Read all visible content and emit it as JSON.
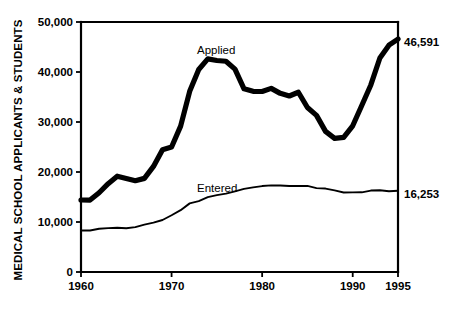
{
  "chart_data": {
    "type": "line",
    "title": "",
    "subtitle": "",
    "xlabel": "",
    "ylabel": "MEDICAL SCHOOL APPLICANTS & STUDENTS",
    "xlim": [
      1960,
      1995
    ],
    "ylim": [
      0,
      50000
    ],
    "grid": false,
    "legend_position": "inline-annotation",
    "x_tick_labels": [
      "1960",
      "1970",
      "1980",
      "1990",
      "1995"
    ],
    "x_ticks": [
      1960,
      1970,
      1980,
      1990,
      1995
    ],
    "y_tick_labels": [
      "0",
      "10,000",
      "20,000",
      "30,000",
      "40,000",
      "50,000"
    ],
    "y_ticks": [
      0,
      10000,
      20000,
      30000,
      40000,
      50000
    ],
    "x": [
      1960,
      1961,
      1962,
      1963,
      1964,
      1965,
      1966,
      1967,
      1968,
      1969,
      1970,
      1971,
      1972,
      1973,
      1974,
      1975,
      1976,
      1977,
      1978,
      1979,
      1980,
      1981,
      1982,
      1983,
      1984,
      1985,
      1986,
      1987,
      1988,
      1989,
      1990,
      1991,
      1992,
      1993,
      1994,
      1995
    ],
    "series": [
      {
        "name": "Applied",
        "label": "Applied",
        "line_style": "thick",
        "values": [
          14397,
          14381,
          15847,
          17668,
          19168,
          18703,
          18250,
          18724,
          21118,
          24465,
          24987,
          29172,
          36135,
          40506,
          42624,
          42303,
          42155,
          40569,
          36636,
          36141,
          36100,
          36727,
          35730,
          35200,
          35944,
          32893,
          31323,
          28123,
          26721,
          26915,
          29243,
          33301,
          37410,
          42808,
          45365,
          46591
        ]
      },
      {
        "name": "Entered",
        "label": "Entered",
        "line_style": "thin",
        "values": [
          8298,
          8298,
          8642,
          8772,
          8856,
          8759,
          8964,
          9479,
          9863,
          10401,
          11348,
          12361,
          13726,
          14185,
          14963,
          15365,
          15667,
          16134,
          16620,
          16930,
          17186,
          17320,
          17294,
          17209,
          17194,
          17228,
          16779,
          16687,
          16320,
          15900,
          15927,
          15937,
          16289,
          16361,
          16160,
          16253
        ]
      }
    ],
    "annotations": [
      {
        "name": "applied-series-label",
        "text": "Applied",
        "x": 1973.5,
        "y": 47500
      },
      {
        "name": "entered-series-label",
        "text": "Entered",
        "x": 1973.5,
        "y": 19400
      },
      {
        "name": "applied-end-value-label",
        "text": "46,591",
        "x": 1995,
        "y": 46591
      },
      {
        "name": "entered-end-value-label",
        "text": "16,253",
        "x": 1995,
        "y": 16253
      }
    ],
    "colors": {
      "background": "#ffffff",
      "foreground": "#000000",
      "applied_line": "#000000",
      "entered_line": "#000000"
    }
  }
}
